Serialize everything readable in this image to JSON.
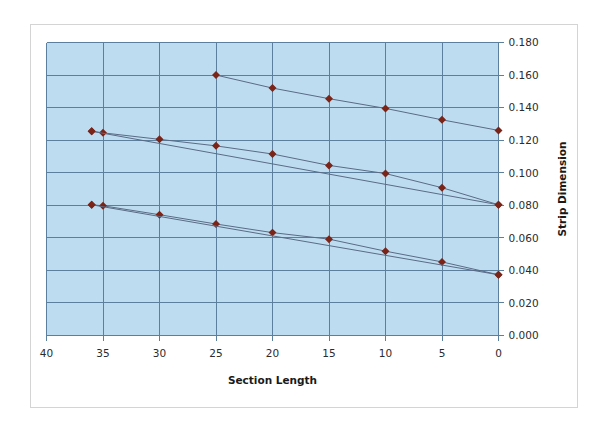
{
  "figure": {
    "background_color": "#ffffff",
    "frame_border_color": "#d4d4d4"
  },
  "chart_data": {
    "type": "line",
    "title": "",
    "subtitle": "",
    "xlabel": "Section Length",
    "ylabel": "Strip Dimension",
    "xlim": [
      40,
      0
    ],
    "ylim": [
      0.0,
      0.18
    ],
    "x_ticks": [
      40,
      35,
      30,
      25,
      20,
      15,
      10,
      5,
      0
    ],
    "x_tick_labels": [
      "40",
      "35",
      "30",
      "25",
      "20",
      "15",
      "10",
      "5",
      "0"
    ],
    "y_ticks": [
      0.0,
      0.02,
      0.04,
      0.06,
      0.08,
      0.1,
      0.12,
      0.14,
      0.16,
      0.18
    ],
    "y_tick_labels": [
      "0.000",
      "0.020",
      "0.040",
      "0.060",
      "0.080",
      "0.100",
      "0.120",
      "0.140",
      "0.160",
      "0.180"
    ],
    "x_axis_reversed": true,
    "grid": true,
    "grid_color": "#5c7f9e",
    "plot_background": "#bddcef",
    "legend": false,
    "legend_position": "none",
    "marker_color": "#7b2418",
    "line_color": "#5a6b86",
    "series": [
      {
        "name": "series-1-upper",
        "x": [
          25,
          20,
          15,
          10,
          5,
          0
        ],
        "values": [
          0.16,
          0.152,
          0.1455,
          0.1395,
          0.1325,
          0.126
        ]
      },
      {
        "name": "series-2-middle-a",
        "x": [
          36,
          35,
          30,
          25,
          20,
          15,
          10,
          5,
          0
        ],
        "values": [
          0.1255,
          0.1245,
          0.1205,
          0.1165,
          0.1115,
          0.1045,
          0.0995,
          0.0908,
          0.0803
        ]
      },
      {
        "name": "series-3-middle-b",
        "x": [
          36,
          0
        ],
        "values": [
          0.1255,
          0.0803
        ]
      },
      {
        "name": "series-4-lower-a",
        "x": [
          36,
          35,
          30,
          25,
          20,
          15,
          10,
          5,
          0
        ],
        "values": [
          0.0803,
          0.0797,
          0.0742,
          0.0685,
          0.0632,
          0.0592,
          0.0518,
          0.0452,
          0.0373
        ]
      },
      {
        "name": "series-5-lower-b",
        "x": [
          36,
          0
        ],
        "values": [
          0.0803,
          0.0373
        ]
      }
    ]
  }
}
